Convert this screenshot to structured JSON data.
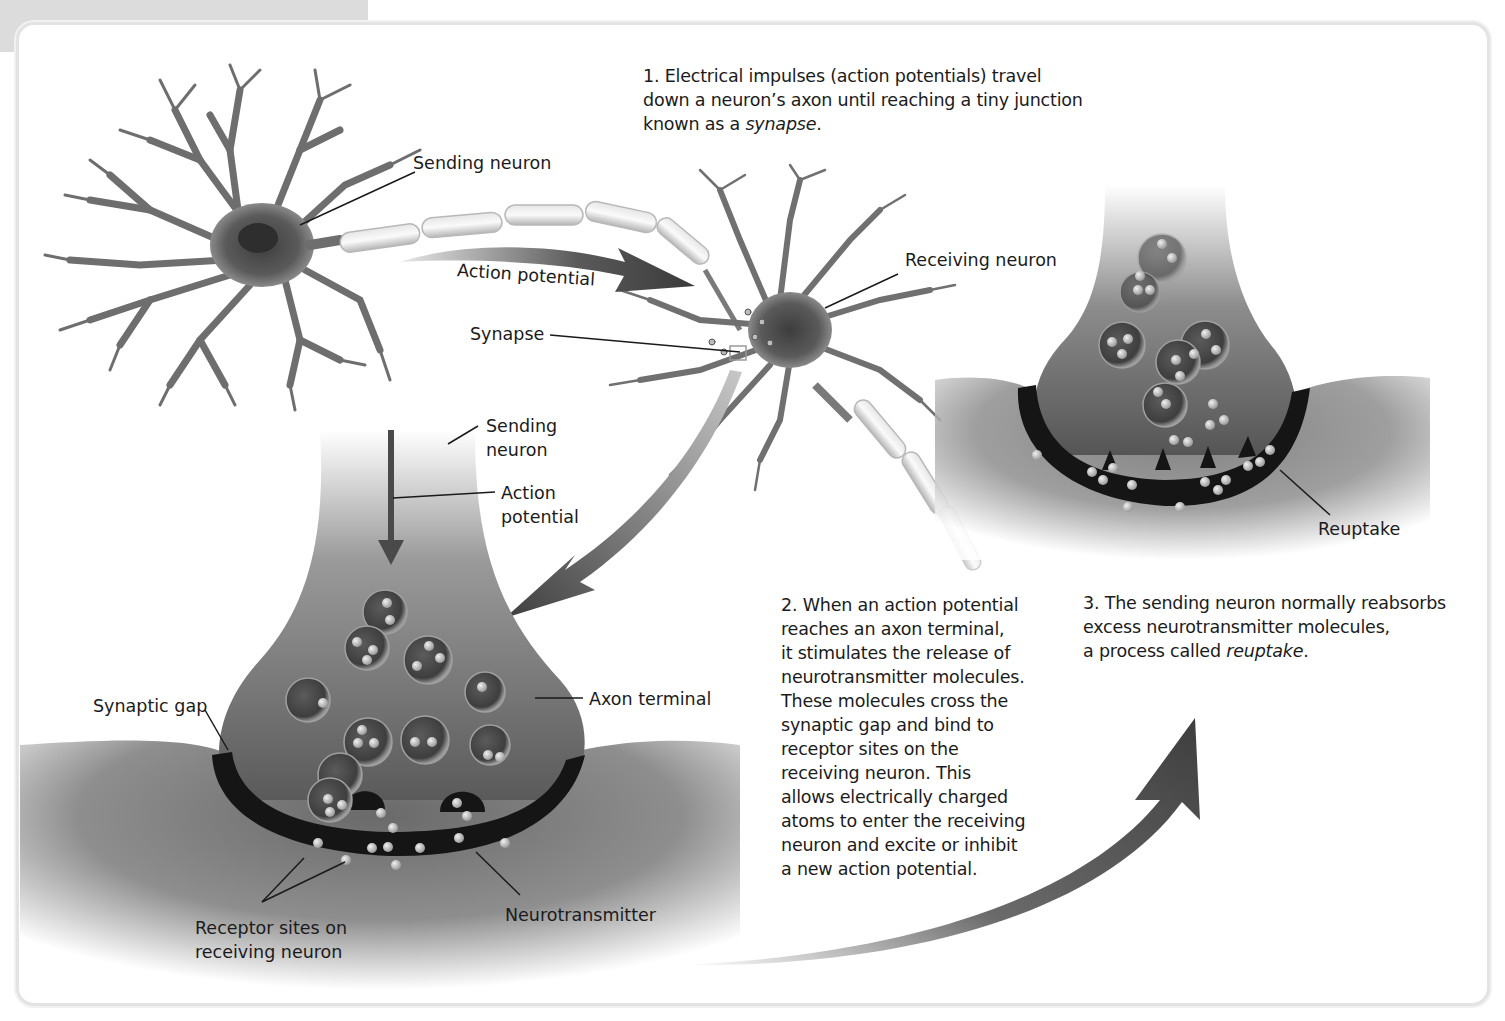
{
  "figure": {
    "colors": {
      "background": "#ffffff",
      "frame_border": "#e3e3e3",
      "header_tab": "#dcdcdc",
      "neuron_gray": "#6e6e6e",
      "terminal_dark": "#3a3a3a",
      "gap_black": "#151515",
      "molecule": "#c8c8c8",
      "text": "#1b1b1b"
    }
  },
  "steps": [
    {
      "number": "1.",
      "lines": [
        "Electrical impulses (action potentials) travel",
        "down a neuron’s axon until reaching a tiny junction",
        "known as a "
      ],
      "emphasis": "synapse",
      "tail": "."
    },
    {
      "number": "2.",
      "lines": [
        "When an action potential",
        "reaches an axon terminal,",
        "it stimulates the release of",
        "neurotransmitter molecules.",
        "These molecules cross the",
        "synaptic gap and bind to",
        "receptor sites on the",
        "receiving neuron. This",
        "allows electrically charged",
        "atoms to enter the receiving",
        "neuron and excite or inhibit",
        "a new action potential."
      ]
    },
    {
      "number": "3.",
      "lines": [
        "The sending neuron normally reabsorbs",
        "excess neurotransmitter molecules,",
        "a process called "
      ],
      "emphasis": "reuptake",
      "tail": "."
    }
  ],
  "labels": {
    "sending_neuron_top": "Sending neuron",
    "action_potential_arc": "Action potential",
    "synapse": "Synapse",
    "receiving_neuron": "Receiving neuron",
    "sending_neuron_terminal_1": "Sending",
    "sending_neuron_terminal_2": "neuron",
    "action_potential_terminal_1": "Action",
    "action_potential_terminal_2": "potential",
    "synaptic_gap": "Synaptic gap",
    "axon_terminal": "Axon terminal",
    "receptor_sites_1": "Receptor sites on",
    "receptor_sites_2": "receiving neuron",
    "neurotransmitter": "Neurotransmitter",
    "reuptake": "Reuptake"
  },
  "icons": {
    "arrows": [
      "action-potential-arrow",
      "down-to-terminal-arrow",
      "terminal-action-potential-arrow",
      "to-reuptake-arrow"
    ]
  }
}
